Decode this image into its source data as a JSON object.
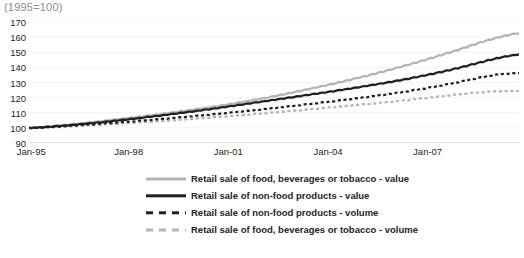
{
  "chart_data": {
    "type": "line",
    "title": "(1995=100)",
    "xlabel": "",
    "ylabel": "",
    "ylim": [
      90,
      170
    ],
    "yticks": [
      90,
      100,
      110,
      120,
      130,
      140,
      150,
      160,
      170
    ],
    "grid": true,
    "legend_position": "bottom",
    "x_tick_labels": [
      "Jan-95",
      "Jan-98",
      "Jan-01",
      "Jan-04",
      "Jan-07"
    ],
    "x_tick_index": [
      0,
      36,
      72,
      108,
      144
    ],
    "x_range_months": [
      0,
      177
    ],
    "series": [
      {
        "name": "Retail sale of food, beverages or tobacco - value",
        "style": "solid",
        "color": "#b3b3b3",
        "values": [
          100,
          100.2,
          99.8,
          100.4,
          100.6,
          100.3,
          100.8,
          101,
          100.7,
          101.2,
          101.5,
          101.3,
          101.6,
          102,
          101.8,
          102.3,
          102.6,
          102.4,
          102.9,
          103.2,
          103,
          103.5,
          103.8,
          103.6,
          104,
          104.4,
          104.2,
          104.7,
          105,
          104.8,
          105.3,
          105.6,
          105.4,
          105.9,
          106.3,
          106.1,
          106.5,
          106.9,
          106.7,
          107.2,
          107.6,
          107.4,
          107.9,
          108.3,
          108.1,
          108.6,
          109,
          108.8,
          109.3,
          109.7,
          109.5,
          110,
          110.4,
          110.2,
          110.8,
          111.2,
          111,
          111.5,
          111.9,
          111.7,
          112.3,
          112.7,
          112.5,
          113.1,
          113.5,
          113.3,
          113.9,
          114.3,
          114.1,
          114.7,
          115.2,
          115,
          115.6,
          116.1,
          115.9,
          116.5,
          117,
          116.8,
          117.4,
          117.9,
          117.7,
          118.4,
          118.9,
          118.7,
          119.4,
          119.9,
          119.7,
          120.4,
          121,
          120.8,
          121.5,
          122.1,
          121.9,
          122.6,
          123.2,
          123,
          123.7,
          124.3,
          124.1,
          124.9,
          125.5,
          125.3,
          126.1,
          126.7,
          126.5,
          127.3,
          127.9,
          127.7,
          128.5,
          129.1,
          128.9,
          129.7,
          130.4,
          130.2,
          131,
          131.7,
          131.5,
          132.3,
          133,
          132.8,
          133.6,
          134.3,
          134.1,
          135,
          135.7,
          135.5,
          136.4,
          137.1,
          136.9,
          137.8,
          138.6,
          138.4,
          139.3,
          140.1,
          139.9,
          140.8,
          141.6,
          141.4,
          142.3,
          143.1,
          142.9,
          143.9,
          144.7,
          144.5,
          145.5,
          146.3,
          146.1,
          147.1,
          148,
          147.8,
          148.8,
          149.7,
          149.5,
          150.5,
          151.4,
          151.2,
          152.3,
          153.2,
          153,
          154.1,
          155,
          154.8,
          155.9,
          156.8,
          156.6,
          157.6,
          158.4,
          158.2,
          159.1,
          159.9,
          159.7,
          160.5,
          161.2,
          161,
          161.7,
          162.3,
          162.1,
          162.7,
          163.1,
          163.4
        ]
      },
      {
        "name": "Retail sale of non-food products - value",
        "style": "solid",
        "color": "#231f20",
        "values": [
          100,
          99.9,
          100.3,
          100.1,
          100.5,
          100.2,
          100.7,
          100.9,
          100.6,
          101,
          101.3,
          101.1,
          101.4,
          101.7,
          101.5,
          101.9,
          102.2,
          102,
          102.4,
          102.7,
          102.5,
          102.9,
          103.2,
          103,
          103.4,
          103.7,
          103.5,
          103.9,
          104.3,
          104.1,
          104.5,
          104.9,
          104.7,
          105.1,
          105.5,
          105.3,
          105.7,
          106.1,
          105.9,
          106.3,
          106.7,
          106.5,
          107,
          107.4,
          107.2,
          107.6,
          108,
          107.8,
          108.3,
          108.7,
          108.5,
          109,
          109.4,
          109.2,
          109.7,
          110.1,
          109.9,
          110.4,
          110.8,
          110.6,
          111.1,
          111.5,
          111.3,
          111.9,
          112.3,
          112.1,
          112.6,
          113,
          112.8,
          113.4,
          113.8,
          113.6,
          114.2,
          114.6,
          114.4,
          115,
          115.4,
          115.2,
          115.8,
          116.2,
          116,
          116.6,
          117,
          116.8,
          117.4,
          117.8,
          117.6,
          118.2,
          118.6,
          118.4,
          119,
          119.4,
          119.2,
          119.8,
          120.2,
          120,
          120.5,
          121,
          120.8,
          121.4,
          121.8,
          121.6,
          122.2,
          122.6,
          122.4,
          123,
          123.4,
          123.2,
          123.8,
          124.2,
          124,
          124.6,
          125.1,
          124.9,
          125.5,
          125.9,
          125.7,
          126.3,
          126.8,
          126.6,
          127.2,
          127.7,
          127.5,
          128.1,
          128.6,
          128.4,
          129,
          129.5,
          129.3,
          129.9,
          130.4,
          130.2,
          130.9,
          131.4,
          131.2,
          131.9,
          132.4,
          132.2,
          132.9,
          133.5,
          133.3,
          134,
          134.6,
          134.4,
          135.1,
          135.7,
          135.5,
          136.3,
          136.9,
          136.7,
          137.5,
          138.1,
          137.9,
          138.7,
          139.4,
          139.2,
          140.1,
          140.8,
          140.6,
          141.5,
          142.2,
          142,
          142.9,
          143.6,
          143.4,
          144.3,
          145,
          144.8,
          145.6,
          146.3,
          146.1,
          146.8,
          147.4,
          147.2,
          147.8,
          148.3,
          148.1,
          148.6,
          148.9,
          149.2
        ]
      },
      {
        "name": "Retail sale of non-food products - volume",
        "style": "dashed",
        "color": "#231f20",
        "values": [
          100,
          99.8,
          100.2,
          100,
          100.3,
          100.1,
          100.5,
          100.6,
          100.4,
          100.8,
          101,
          100.8,
          101.1,
          101.3,
          101.1,
          101.4,
          101.7,
          101.5,
          101.8,
          102,
          101.8,
          102.2,
          102.4,
          102.2,
          102.5,
          102.8,
          102.6,
          102.9,
          103.2,
          103,
          103.3,
          103.6,
          103.4,
          103.7,
          104,
          103.8,
          104.1,
          104.4,
          104.2,
          104.6,
          104.9,
          104.7,
          105,
          105.3,
          105.1,
          105.5,
          105.8,
          105.6,
          105.9,
          106.2,
          106,
          106.4,
          106.7,
          106.5,
          106.9,
          107.2,
          107,
          107.4,
          107.7,
          107.5,
          107.9,
          108.2,
          108,
          108.4,
          108.7,
          108.5,
          108.9,
          109.2,
          109,
          109.4,
          109.8,
          109.6,
          110,
          110.3,
          110.1,
          110.5,
          110.9,
          110.7,
          111.1,
          111.4,
          111.2,
          111.6,
          112,
          111.8,
          112.2,
          112.6,
          112.4,
          112.8,
          113.2,
          113,
          113.4,
          113.8,
          113.6,
          114,
          114.4,
          114.2,
          114.6,
          115,
          114.8,
          115.3,
          115.7,
          115.5,
          115.9,
          116.3,
          116.1,
          116.6,
          117,
          116.8,
          117.2,
          117.6,
          117.4,
          117.9,
          118.3,
          118.1,
          118.5,
          119,
          118.8,
          119.2,
          119.7,
          119.5,
          119.9,
          120.4,
          120.2,
          120.6,
          121.1,
          120.9,
          121.4,
          121.8,
          121.6,
          122.1,
          122.6,
          122.4,
          122.9,
          123.4,
          123.2,
          123.7,
          124.2,
          124,
          124.6,
          125.1,
          124.9,
          125.5,
          126,
          125.8,
          126.4,
          127,
          126.8,
          127.4,
          128,
          127.8,
          128.4,
          129,
          128.8,
          129.5,
          130.1,
          129.9,
          130.6,
          131.2,
          131,
          131.8,
          132.4,
          132.2,
          132.9,
          133.5,
          133.3,
          134,
          134.6,
          134.4,
          134.9,
          135.4,
          135.2,
          135.6,
          135.9,
          135.7,
          136,
          136.2,
          136,
          136.2,
          136.3,
          136.4
        ]
      },
      {
        "name": "Retail sale of food, beverages or tobacco - volume",
        "style": "dashed",
        "color": "#b3b3b3",
        "values": [
          100,
          99.9,
          100.1,
          99.9,
          100.2,
          100,
          100.3,
          100.4,
          100.2,
          100.5,
          100.7,
          100.5,
          100.7,
          100.9,
          100.7,
          101,
          101.2,
          101,
          101.3,
          101.5,
          101.3,
          101.6,
          101.8,
          101.6,
          101.9,
          102.1,
          101.9,
          102.2,
          102.4,
          102.2,
          102.5,
          102.7,
          102.5,
          102.8,
          103.1,
          102.9,
          103.1,
          103.4,
          103.2,
          103.5,
          103.7,
          103.5,
          103.8,
          104.1,
          103.9,
          104.2,
          104.4,
          104.2,
          104.5,
          104.8,
          104.6,
          104.9,
          105.2,
          105,
          105.3,
          105.6,
          105.4,
          105.7,
          106,
          105.8,
          106.1,
          106.4,
          106.2,
          106.5,
          106.8,
          106.6,
          106.9,
          107.2,
          107,
          107.3,
          107.6,
          107.4,
          107.7,
          108,
          107.8,
          108.2,
          108.5,
          108.3,
          108.6,
          108.9,
          108.7,
          109.1,
          109.4,
          109.2,
          109.5,
          109.8,
          109.6,
          110,
          110.3,
          110.1,
          110.4,
          110.8,
          110.6,
          110.9,
          111.3,
          111.1,
          111.4,
          111.7,
          111.5,
          111.9,
          112.2,
          112,
          112.4,
          112.7,
          112.5,
          112.9,
          113.2,
          113,
          113.4,
          113.7,
          113.5,
          113.9,
          114.2,
          114,
          114.4,
          114.7,
          114.5,
          114.9,
          115.2,
          115,
          115.4,
          115.7,
          115.5,
          115.9,
          116.2,
          116,
          116.4,
          116.8,
          116.6,
          117,
          117.3,
          117.1,
          117.5,
          117.9,
          117.7,
          118.1,
          118.5,
          118.3,
          118.7,
          119.1,
          118.9,
          119.3,
          119.7,
          119.5,
          119.9,
          120.3,
          120.1,
          120.5,
          120.9,
          120.7,
          121.1,
          121.5,
          121.3,
          121.7,
          122.1,
          121.9,
          122.3,
          122.7,
          122.5,
          122.9,
          123.2,
          123,
          123.4,
          123.7,
          123.5,
          123.8,
          124.1,
          123.9,
          124.1,
          124.3,
          124.1,
          124.3,
          124.4,
          124.2,
          124.4,
          124.5,
          124.3,
          124.4,
          124.4,
          124.5
        ]
      }
    ]
  }
}
